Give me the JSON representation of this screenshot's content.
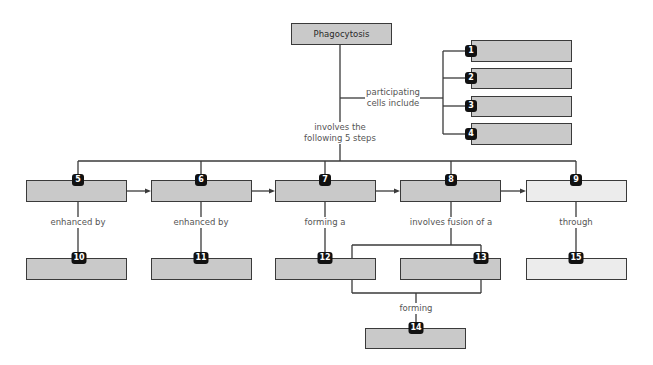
{
  "diagram": {
    "root": {
      "label": "Phagocytosis"
    },
    "participating_cells_label": "participating cells include",
    "participating_cells_label_lines": [
      "participating",
      "cells include"
    ],
    "steps_label_lines": [
      "involves the",
      "following 5 steps"
    ],
    "cell_boxes": [
      {
        "number": "1",
        "text": ""
      },
      {
        "number": "2",
        "text": ""
      },
      {
        "number": "3",
        "text": ""
      },
      {
        "number": "4",
        "text": ""
      }
    ],
    "steps": [
      {
        "number": "5",
        "text": "",
        "connector": "enhanced by",
        "child": {
          "number": "10",
          "text": ""
        }
      },
      {
        "number": "6",
        "text": "",
        "connector": "enhanced by",
        "child": {
          "number": "11",
          "text": ""
        }
      },
      {
        "number": "7",
        "text": "",
        "connector": "forming a",
        "child": {
          "number": "12",
          "text": ""
        }
      },
      {
        "number": "8",
        "text": "",
        "connector": "involves fusion of a",
        "child": {
          "number": "13",
          "text": ""
        }
      },
      {
        "number": "9",
        "text": "",
        "connector": "through",
        "child": {
          "number": "15",
          "text": ""
        }
      }
    ],
    "fusion_result": {
      "connector": "forming",
      "number": "14",
      "text": ""
    },
    "colors": {
      "box_fill": "#c9c9c9",
      "box_fill_light": "#ececec",
      "badge": "#111111",
      "line": "#3a3a3a"
    }
  }
}
